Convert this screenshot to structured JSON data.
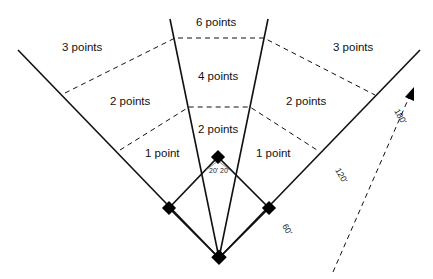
{
  "diagram": {
    "type": "baseball field scoring zones",
    "zones": {
      "left_outer": "3 points",
      "center_outer": "6 points",
      "right_outer": "3 points",
      "left_middle": "2 points",
      "center_middle": "4 points",
      "right_middle": "2 points",
      "left_inner": "1 point",
      "center_inner": "2 points",
      "right_inner": "1 point"
    },
    "angle_labels": {
      "left": "20'",
      "right": "20'"
    },
    "distance_labels": [
      "60'",
      "120'",
      "180'"
    ],
    "colors": {
      "line": "#111111",
      "background": "#ffffff"
    }
  }
}
